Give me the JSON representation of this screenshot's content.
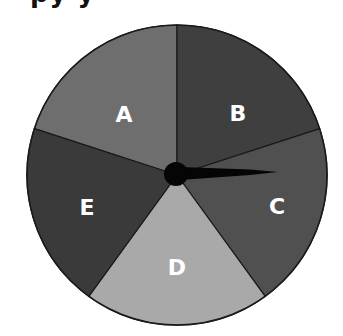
{
  "title_cropped": "py    y",
  "spinner": {
    "sections": [
      {
        "label": "A",
        "color": "#6e6e6e"
      },
      {
        "label": "B",
        "color": "#3f3f3f"
      },
      {
        "label": "C",
        "color": "#505050"
      },
      {
        "label": "D",
        "color": "#a9a9a9"
      },
      {
        "label": "E",
        "color": "#3a3a3a"
      }
    ],
    "section_count": 5,
    "pointer_points_to": "C",
    "hub_color": "#000000",
    "outline_color": "#1a1a1a"
  }
}
